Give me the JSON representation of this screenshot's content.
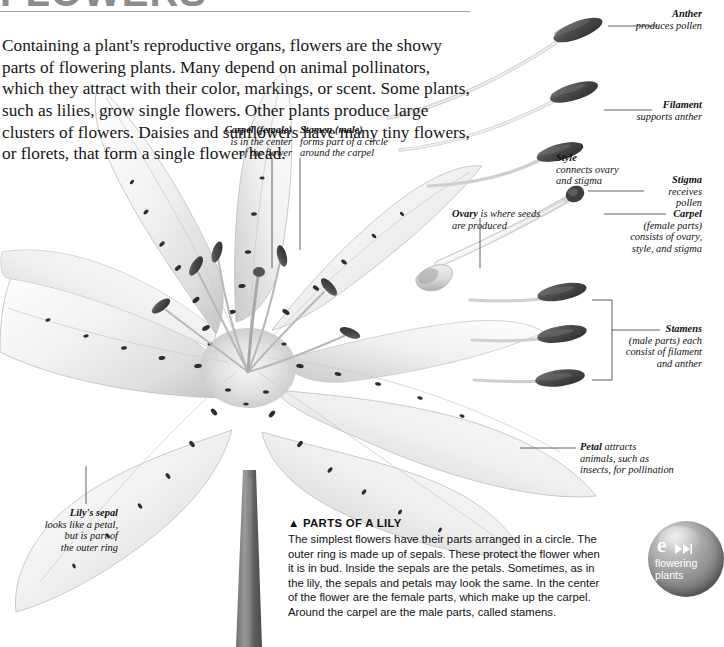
{
  "page": {
    "title": "FLOWERS",
    "intro": "Containing a plant's reproductive organs, flowers are the showy parts of flowering plants. Many depend on animal pollinators, which they attract with their color, markings, or scent. Some plants, such as lilies, grow single flowers. Other plants produce large clusters of flowers. Daisies and sunflowers have many tiny flowers, or florets, that form a single flower head."
  },
  "labels": {
    "carpel_female": {
      "term": "Carpel (female)",
      "line1": "is in the center",
      "line2": "of the flower"
    },
    "stamen_male": {
      "term": "Stamen (male)",
      "line1": "forms part of a circle",
      "line2": "around the carpel"
    },
    "anther": {
      "term": "Anther",
      "line1": "produces pollen"
    },
    "filament": {
      "term": "Filament",
      "line1": "supports anther"
    },
    "style": {
      "term": "Style",
      "line1": "connects ovary",
      "line2": "and stigma"
    },
    "stigma": {
      "term": "Stigma",
      "line1": "receives",
      "line2": "pollen"
    },
    "ovary": {
      "term": "Ovary",
      "line1": "is where seeds",
      "line2": "are produced"
    },
    "carpel_parts": {
      "term": "Carpel",
      "line1": "(female parts)",
      "line2": "consists of ovary,",
      "line3": "style, and stigma"
    },
    "stamens": {
      "term": "Stamens",
      "line1": "(male parts) each",
      "line2": "consist of filament",
      "line3": "and anther"
    },
    "petal": {
      "term": "Petal",
      "line1": "attracts",
      "line2": "animals, such as",
      "line3": "insects, for pollination"
    },
    "sepal": {
      "term": "Lily's sepal",
      "line1": "looks like a petal,",
      "line2": "but is part of",
      "line3": "the outer ring"
    }
  },
  "caption": {
    "heading": "▲ PARTS OF A LILY",
    "body": "The simplest flowers have their parts arranged in a circle. The outer ring is made up of sepals. These protect the flower when it is in bud. Inside the sepals are the petals. Sometimes, as in the lily, the sepals and petals may look the same. In the center of the flower are the female parts, which make up the carpel. Around the carpel are the male parts, called stamens."
  },
  "badge": {
    "letter": "e",
    "icon": "fast-forward-icon",
    "line1": "flowering",
    "line2": "plants"
  },
  "colors": {
    "rule": "#9aa3ab",
    "text": "#111111",
    "title": "#8c8c8c",
    "badge": "#909090",
    "anther": "#4a4a4a"
  }
}
